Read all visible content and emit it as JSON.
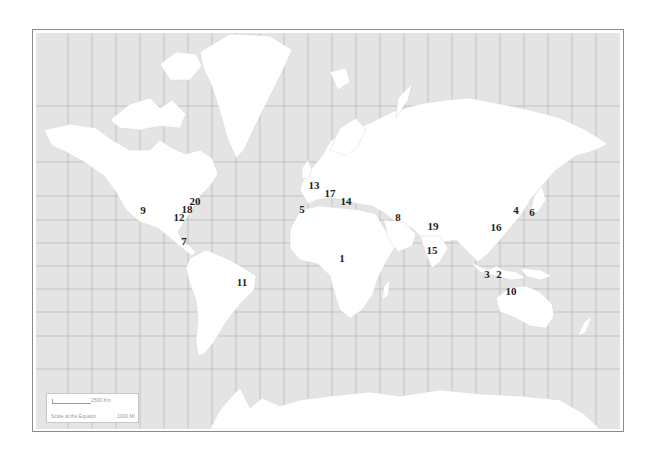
{
  "map": {
    "projection": "mercator",
    "colors": {
      "ocean": "#e4e4e4",
      "land": "#ffffff",
      "grid": "#b4b4b4",
      "frame": "#8a8a8a",
      "label": "#222222"
    },
    "scale": {
      "distance_km": "2500 Km",
      "note": "Scale at the Equator",
      "distance_mi": "1000 Mi"
    },
    "labels": [
      {
        "id": "1",
        "text": "1",
        "x": 342,
        "y": 258
      },
      {
        "id": "2",
        "text": "2",
        "x": 499,
        "y": 274
      },
      {
        "id": "3",
        "text": "3",
        "x": 487,
        "y": 274
      },
      {
        "id": "4",
        "text": "4",
        "x": 516,
        "y": 210
      },
      {
        "id": "5",
        "text": "5",
        "x": 302,
        "y": 209
      },
      {
        "id": "6",
        "text": "6",
        "x": 532,
        "y": 212
      },
      {
        "id": "7",
        "text": "7",
        "x": 184,
        "y": 241
      },
      {
        "id": "8",
        "text": "8",
        "x": 398,
        "y": 217
      },
      {
        "id": "9",
        "text": "9",
        "x": 143,
        "y": 210
      },
      {
        "id": "10",
        "text": "10",
        "x": 511,
        "y": 291
      },
      {
        "id": "11",
        "text": "11",
        "x": 242,
        "y": 282
      },
      {
        "id": "12",
        "text": "12",
        "x": 179,
        "y": 217
      },
      {
        "id": "13",
        "text": "13",
        "x": 314,
        "y": 185
      },
      {
        "id": "14",
        "text": "14",
        "x": 346,
        "y": 201
      },
      {
        "id": "15",
        "text": "15",
        "x": 432,
        "y": 250
      },
      {
        "id": "16",
        "text": "16",
        "x": 496,
        "y": 227
      },
      {
        "id": "17",
        "text": "17",
        "x": 330,
        "y": 193
      },
      {
        "id": "18",
        "text": "18",
        "x": 187,
        "y": 209
      },
      {
        "id": "19",
        "text": "19",
        "x": 433,
        "y": 226
      },
      {
        "id": "20",
        "text": "20",
        "x": 195,
        "y": 201
      }
    ]
  }
}
